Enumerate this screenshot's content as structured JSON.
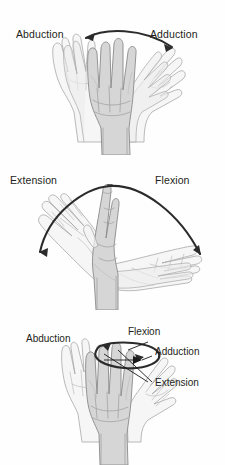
{
  "figure": {
    "background_color": "#fefefe",
    "label_color": "#231f20",
    "arrow_color": "#2b2b2b",
    "hand_fill_color": "#d6d6d6",
    "hand_outline_color": "#8a8a8a",
    "ghost_fill_color": "#f2f2f2"
  },
  "panels": [
    {
      "id": "abduction-adduction",
      "name": "Abduction and adduction of the wrist",
      "labels": [
        {
          "text": "Abduction",
          "position": "top-left"
        },
        {
          "text": "Adduction",
          "position": "top-right"
        }
      ],
      "arrow": {
        "type": "double-headed-arc",
        "direction": "bidirectional",
        "description": "Arc spanning above the fingertips with arrowheads at both ends"
      },
      "hands": [
        "center-neutral",
        "ghost-left-abducted",
        "ghost-right-adducted"
      ]
    },
    {
      "id": "flexion-extension",
      "name": "Flexion and extension of the wrist",
      "labels": [
        {
          "text": "Extension",
          "position": "top-left"
        },
        {
          "text": "Flexion",
          "position": "top-right"
        }
      ],
      "arrow": {
        "type": "double-headed-arc",
        "direction": "bidirectional",
        "description": "Wide arc over the upright hand with arrowheads at both lower ends"
      },
      "hands": [
        "center-upright",
        "ghost-left-extended",
        "ghost-right-flexed"
      ]
    },
    {
      "id": "circumduction",
      "name": "Circumduction of the wrist",
      "labels": [
        {
          "text": "Abduction",
          "position": "left"
        },
        {
          "text": "Flexion",
          "position": "top-right"
        },
        {
          "text": "Adduction",
          "position": "right"
        },
        {
          "text": "Extension",
          "position": "lower-right"
        }
      ],
      "arrow": {
        "type": "ellipse-loop",
        "direction": "clockwise",
        "description": "Elliptical circumduction loop around the fingertips with two arrowheads"
      },
      "hands": [
        "center-neutral",
        "ghost-left",
        "ghost-right"
      ]
    }
  ]
}
